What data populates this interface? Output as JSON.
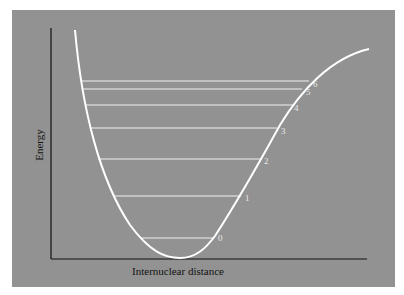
{
  "diagram": {
    "y_axis_label": "Energy",
    "x_axis_label": "Internuclear distance",
    "colors": {
      "background": "#ffffff",
      "panel": "#929292",
      "curve": "#ffffff",
      "axes": "#111111",
      "levels": "#f0f0f0"
    },
    "levels": [
      {
        "label": "0"
      },
      {
        "label": "1"
      },
      {
        "label": "2"
      },
      {
        "label": "3"
      },
      {
        "label": "4"
      },
      {
        "label": "5"
      },
      {
        "label": "6"
      }
    ]
  }
}
